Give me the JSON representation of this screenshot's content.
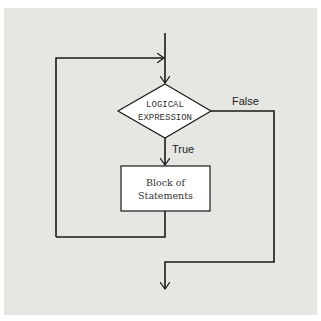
{
  "diagram": {
    "type": "flowchart",
    "title": "",
    "nodes": {
      "decision": {
        "shape": "diamond",
        "line1": "LOGICAL",
        "line2": "EXPRESSION"
      },
      "process": {
        "shape": "rectangle",
        "line1": "Block of",
        "line2": "Statements"
      }
    },
    "edges": {
      "true_label": "True",
      "false_label": "False"
    },
    "colors": {
      "background": "#e6e6e3",
      "node_fill": "#ffffff",
      "line": "#1a1a1a"
    }
  }
}
